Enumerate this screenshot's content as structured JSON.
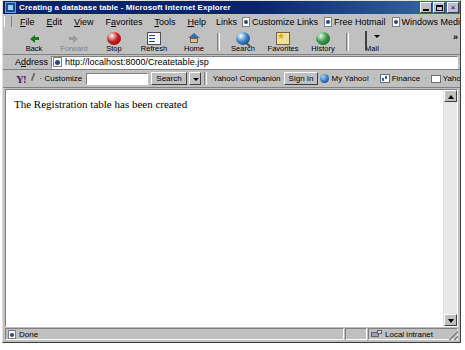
{
  "window": {
    "title": "Creating a database table - Microsoft Internet Explorer",
    "icon": "ie-page-icon",
    "minimize_label": "",
    "restore_label": "",
    "close_label": "×"
  },
  "menu": {
    "items": [
      {
        "label": "File",
        "accel": "F"
      },
      {
        "label": "Edit",
        "accel": "E"
      },
      {
        "label": "View",
        "accel": "V"
      },
      {
        "label": "Favorites",
        "accel": "a"
      },
      {
        "label": "Tools",
        "accel": "T"
      },
      {
        "label": "Help",
        "accel": "H"
      }
    ]
  },
  "links": {
    "label": "Links",
    "items": [
      {
        "label": "Customize Links"
      },
      {
        "label": "Free Hotmail"
      },
      {
        "label": "Windows Media"
      },
      {
        "label": "Windows"
      }
    ]
  },
  "toolbar": {
    "buttons": [
      {
        "label": "Back",
        "icon": "back-arrow-icon",
        "enabled": true
      },
      {
        "label": "Forward",
        "icon": "forward-arrow-icon",
        "enabled": false
      },
      {
        "label": "Stop",
        "icon": "stop-icon",
        "enabled": true
      },
      {
        "label": "Refresh",
        "icon": "refresh-icon",
        "enabled": true
      },
      {
        "label": "Home",
        "icon": "home-icon",
        "enabled": true
      },
      {
        "label": "Search",
        "icon": "search-icon",
        "enabled": true
      },
      {
        "label": "Favorites",
        "icon": "favorites-star-icon",
        "enabled": true
      },
      {
        "label": "History",
        "icon": "history-icon",
        "enabled": true
      },
      {
        "label": "Mail",
        "icon": "mail-icon",
        "enabled": true
      }
    ],
    "overflow_label": "»"
  },
  "address": {
    "label": "Address",
    "url": "http://localhost:8000/Createtable.jsp",
    "icon": "page-icon"
  },
  "yahoo_toolbar": {
    "logo": "Y!",
    "pencil_icon": "pencil-icon",
    "customize_label": "· Customize",
    "search_value": "",
    "search_placeholder": "",
    "search_button": "Search",
    "companion_label": "Yahoo! Companion",
    "signin_label": "Sign In",
    "my_yahoo_label": "My Yahoo!",
    "finance_label": "Finance",
    "mail_label": "Yahoo! Mail",
    "bullet": "·",
    "overflow_label": "»"
  },
  "page": {
    "text": "The Registration table has been created"
  },
  "scrollbar": {
    "up_label": "",
    "down_label": ""
  },
  "statusbar": {
    "message": "Done",
    "zone": "Local intranet",
    "zone_icon": "local-intranet-icon",
    "doc_icon": "page-icon"
  },
  "colors": {
    "titlebar_start": "#0a246a",
    "titlebar_end": "#3a6ea5",
    "chrome": "#c0c0c0",
    "page_background": "#ffffff",
    "text": "#000000"
  }
}
